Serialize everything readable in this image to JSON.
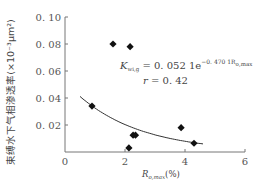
{
  "chart_data": {
    "type": "scatter",
    "title": "",
    "xlabel": "R_{o,max}(%)",
    "xlabel_main": "R",
    "xlabel_sub": "o,max",
    "xlabel_unit": "(%)",
    "ylabel": "束缚水下气相渗透率(×10⁻³μm²)",
    "xlim": [
      0,
      6
    ],
    "ylim": [
      0,
      0.1
    ],
    "xticks": [
      0,
      2,
      4,
      6
    ],
    "xtick_labels": [
      "0",
      "2",
      "4",
      "6"
    ],
    "yticks": [
      0.02,
      0.04,
      0.06,
      0.08,
      0.1
    ],
    "ytick_labels": [
      "0.02",
      "0.04",
      "0.06",
      "0.08",
      "0.10"
    ],
    "grid": false,
    "series": [
      {
        "name": "samples",
        "marker": "diamond",
        "points": [
          {
            "x": 0.9,
            "y": 0.034
          },
          {
            "x": 1.6,
            "y": 0.08
          },
          {
            "x": 2.17,
            "y": 0.078
          },
          {
            "x": 2.13,
            "y": 0.003
          },
          {
            "x": 2.27,
            "y": 0.0125
          },
          {
            "x": 2.35,
            "y": 0.0125
          },
          {
            "x": 3.87,
            "y": 0.018
          },
          {
            "x": 4.3,
            "y": 0.0065
          }
        ]
      }
    ],
    "fit": {
      "type": "exponential",
      "a": 0.0521,
      "b": -0.4701,
      "x_range": [
        0.5,
        4.6
      ]
    },
    "annotations": {
      "equation_lhs": "K",
      "equation_lhs_sub": "wi,g",
      "equation_rhs": " = 0. 052 1e",
      "equation_exp": "−0. 470 1R",
      "equation_exp_sub": "o,max",
      "r_label": "r",
      "r_value": " = 0. 42"
    }
  }
}
